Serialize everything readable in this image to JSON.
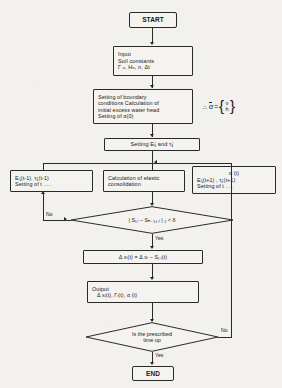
{
  "diagram": {
    "type": "flowchart",
    "nodes": {
      "start": {
        "label": "START",
        "shape": "terminator"
      },
      "input": {
        "line1": "Input",
        "line2": "Soil constants",
        "line3": "Γ ₒ, Hₒ, n, Δt",
        "shape": "process"
      },
      "boundary": {
        "line1": "Setting of boundary",
        "line2": "conditions Calculation of",
        "line3": "initial excess water head",
        "line4": "Setting of α(0)",
        "shape": "process"
      },
      "setting_e_tau": {
        "label": "Setting Eᵢⱼ and τᵢⱼ",
        "shape": "process"
      },
      "left_box": {
        "line1": "Eᵢⱼ(t-1),   τᵢⱼ(t-1)",
        "line2": "Setting of t .....",
        "shape": "process"
      },
      "center_box": {
        "line1": "Calculation of elastic",
        "line2": "consolidation",
        "shape": "process"
      },
      "right_box": {
        "line1": "α (t)",
        "line2": "Eᵢⱼ(t+1) ,  τᵢⱼ(t+1)",
        "line3": "Setting of t .....",
        "shape": "process"
      },
      "converge_check": {
        "label": "| Sₜ,ᵢ − Sₙ₋₁,ₜ,ᵢ | ₂ < δ",
        "shape": "decision"
      },
      "delta_x": {
        "label": "Δ xᵢ(t) = Δ xᵢ − Sₜ,ᵢ(t)",
        "shape": "process"
      },
      "output": {
        "line1": "Output",
        "line2": "Δ xᵢ(t), Γᵢ(t), α (t)",
        "shape": "process"
      },
      "time_check": {
        "line1": "Is the prescribed",
        "line2": "time up",
        "shape": "decision"
      },
      "end": {
        "label": "END",
        "shape": "terminator"
      }
    },
    "edge_labels": {
      "converge_no": "No",
      "converge_yes": "Yes",
      "time_no": "No",
      "time_yes": "Yes"
    },
    "annotation": {
      "therefore": "∴",
      "symbol": "α",
      "equals": "=",
      "vector_top": "v",
      "vector_bottom": "h"
    },
    "colors": {
      "background": "#f2f1ee",
      "line": "#2a2a28",
      "text": "#191919",
      "box_fill": "#f4f3f0"
    }
  }
}
